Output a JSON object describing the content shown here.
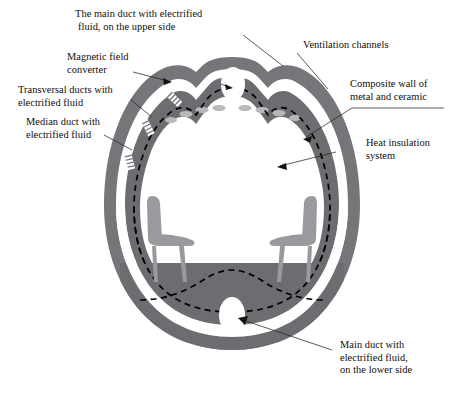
{
  "diagram": {
    "type": "technical-cutaway",
    "background": "#ffffff",
    "colors": {
      "wall_grey": "#76767a",
      "wall_grey_dark": "#6d6d71",
      "channel_white": "#ffffff",
      "chair_grey": "#9a9a9e",
      "chair_grey_dark": "#87878b",
      "dash_black": "#000000",
      "text_black": "#100d0b",
      "leader_line": "#27231f",
      "vent_dash": "#b6b6b8"
    },
    "labels": [
      {
        "id": "main-duct-upper",
        "lines": [
          "The main duct with electrified",
          "fluid, on the upper side"
        ],
        "position": "top-center-left",
        "align": "left"
      },
      {
        "id": "magnetic-field-converter",
        "lines": [
          "Magnetic field",
          "converter"
        ],
        "position": "upper-left",
        "align": "left"
      },
      {
        "id": "transversal-ducts",
        "lines": [
          "Transversal ducts with",
          "electrified fluid"
        ],
        "position": "mid-left",
        "align": "left"
      },
      {
        "id": "median-duct",
        "lines": [
          "Median duct with",
          "electrified fluid"
        ],
        "position": "lower-mid-left",
        "align": "left"
      },
      {
        "id": "ventilation-channels",
        "lines": [
          "Ventilation channels"
        ],
        "position": "top-right",
        "align": "left"
      },
      {
        "id": "composite-wall",
        "lines": [
          "Composite wall of",
          "metal and ceramic"
        ],
        "position": "upper-right",
        "align": "left"
      },
      {
        "id": "heat-insulation",
        "lines": [
          "Heat insulation",
          "system"
        ],
        "position": "mid-right",
        "align": "left"
      },
      {
        "id": "main-duct-lower",
        "lines": [
          "Main duct with",
          "electrified fluid,",
          "on the lower side"
        ],
        "position": "bottom-right",
        "align": "left"
      }
    ],
    "features": {
      "main_duct_upper_opening": "white oval at apex",
      "main_duct_lower_opening": "white oval at base",
      "ventilation_channel_band": "white band between outer and inner wall",
      "heat_insulation_line": "black dashed contour inside inner wall",
      "ceiling_vent_dashes_count": 8,
      "transversal_duct_marks_count": 3,
      "seats_count": 2
    }
  }
}
